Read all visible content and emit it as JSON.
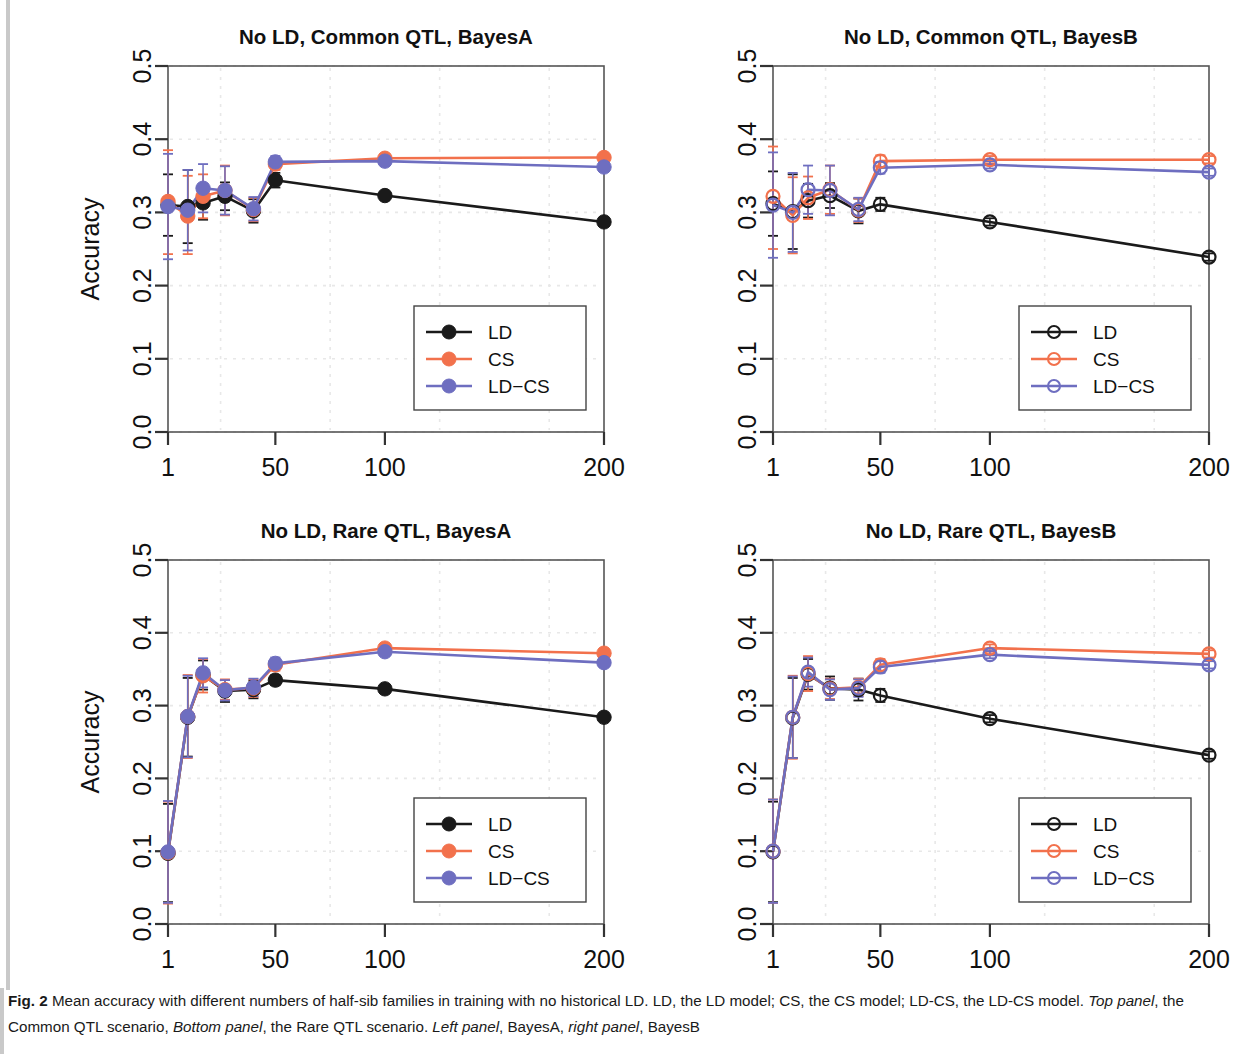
{
  "figure": {
    "label": "Fig. 2",
    "caption_part1": " Mean accuracy with different numbers of half-sib families in training with no historical LD. LD, the LD model; CS, the CS model; LD-CS, the LD-CS model. ",
    "caption_italic1": "Top panel",
    "caption_part2": ", the Common QTL scenario, ",
    "caption_italic2": "Bottom panel",
    "caption_part3": ", the Rare QTL scenario. ",
    "caption_italic3": "Left panel",
    "caption_part4": ", BayesA, ",
    "caption_italic4": "right panel",
    "caption_part5": ", BayesB"
  },
  "colors": {
    "LD": "#1a1a1a",
    "CS": "#F2714C",
    "LD-CS": "#6E6EC0",
    "axis": "#3a3a3a",
    "grid": "#e8e8e8"
  },
  "chart_data": [
    {
      "type": "line",
      "panel_id": "top-left",
      "title": "No LD, Common QTL, BayesA",
      "xlabel": "",
      "ylabel": "Accuracy",
      "marker": "filled",
      "xlim": [
        1,
        200
      ],
      "ylim": [
        0.0,
        0.5
      ],
      "xticks": [
        1,
        50,
        100,
        200
      ],
      "xticklabels": [
        "1",
        "50",
        "100",
        "200"
      ],
      "yticks": [
        0.0,
        0.1,
        0.2,
        0.3,
        0.4,
        0.5
      ],
      "yticklabels": [
        "0.0",
        "0.1",
        "0.2",
        "0.3",
        "0.4",
        "0.5"
      ],
      "grid": true,
      "legend_position": "bottom-right",
      "x": [
        1,
        10,
        17,
        27,
        40,
        50,
        100,
        200
      ],
      "series": [
        {
          "name": "LD",
          "values": [
            0.31,
            0.308,
            0.313,
            0.322,
            0.302,
            0.344,
            0.323,
            0.287
          ],
          "err_low": [
            0.268,
            0.258,
            0.29,
            0.303,
            0.286,
            0.334,
            0.318,
            0.283
          ],
          "err_high": [
            0.352,
            0.358,
            0.336,
            0.341,
            0.318,
            0.354,
            0.328,
            0.291
          ]
        },
        {
          "name": "CS",
          "values": [
            0.315,
            0.295,
            0.322,
            0.33,
            0.304,
            0.366,
            0.374,
            0.375
          ],
          "err_low": [
            0.243,
            0.243,
            0.292,
            0.296,
            0.288,
            0.358,
            0.369,
            0.37
          ],
          "err_high": [
            0.385,
            0.35,
            0.352,
            0.364,
            0.32,
            0.374,
            0.379,
            0.38
          ]
        },
        {
          "name": "LD-CS",
          "values": [
            0.308,
            0.303,
            0.333,
            0.33,
            0.305,
            0.369,
            0.37,
            0.362
          ],
          "err_low": [
            0.236,
            0.248,
            0.3,
            0.297,
            0.289,
            0.361,
            0.365,
            0.357
          ],
          "err_high": [
            0.38,
            0.358,
            0.366,
            0.363,
            0.321,
            0.377,
            0.375,
            0.367
          ]
        }
      ]
    },
    {
      "type": "line",
      "panel_id": "top-right",
      "title": "No LD, Common QTL, BayesB",
      "xlabel": "",
      "ylabel": "",
      "marker": "open",
      "xlim": [
        1,
        200
      ],
      "ylim": [
        0.0,
        0.5
      ],
      "xticks": [
        1,
        50,
        100,
        200
      ],
      "xticklabels": [
        "1",
        "50",
        "100",
        "200"
      ],
      "yticks": [
        0.0,
        0.1,
        0.2,
        0.3,
        0.4,
        0.5
      ],
      "yticklabels": [
        "0.0",
        "0.1",
        "0.2",
        "0.3",
        "0.4",
        "0.5"
      ],
      "grid": true,
      "legend_position": "bottom-right",
      "x": [
        1,
        10,
        17,
        27,
        40,
        50,
        100,
        200
      ],
      "series": [
        {
          "name": "LD",
          "values": [
            0.312,
            0.301,
            0.316,
            0.323,
            0.302,
            0.311,
            0.287,
            0.239
          ],
          "err_low": [
            0.268,
            0.25,
            0.293,
            0.306,
            0.285,
            0.302,
            0.282,
            0.234
          ],
          "err_high": [
            0.356,
            0.352,
            0.339,
            0.34,
            0.319,
            0.32,
            0.292,
            0.244
          ]
        },
        {
          "name": "CS",
          "values": [
            0.322,
            0.296,
            0.32,
            0.331,
            0.303,
            0.37,
            0.372,
            0.372
          ],
          "err_low": [
            0.25,
            0.244,
            0.291,
            0.298,
            0.287,
            0.362,
            0.367,
            0.367
          ],
          "err_high": [
            0.39,
            0.348,
            0.349,
            0.364,
            0.319,
            0.378,
            0.377,
            0.377
          ]
        },
        {
          "name": "LD-CS",
          "values": [
            0.31,
            0.3,
            0.331,
            0.33,
            0.304,
            0.361,
            0.365,
            0.355
          ],
          "err_low": [
            0.238,
            0.246,
            0.298,
            0.296,
            0.288,
            0.353,
            0.36,
            0.35
          ],
          "err_high": [
            0.382,
            0.354,
            0.364,
            0.364,
            0.32,
            0.369,
            0.37,
            0.36
          ]
        }
      ]
    },
    {
      "type": "line",
      "panel_id": "bottom-left",
      "title": "No LD, Rare QTL, BayesA",
      "xlabel": "No. half-sib families in training",
      "ylabel": "Accuracy",
      "marker": "filled",
      "xlim": [
        1,
        200
      ],
      "ylim": [
        0.0,
        0.5
      ],
      "xticks": [
        1,
        50,
        100,
        200
      ],
      "xticklabels": [
        "1",
        "50",
        "100",
        "200"
      ],
      "yticks": [
        0.0,
        0.1,
        0.2,
        0.3,
        0.4,
        0.5
      ],
      "yticklabels": [
        "0.0",
        "0.1",
        "0.2",
        "0.3",
        "0.4",
        "0.5"
      ],
      "grid": true,
      "legend_position": "bottom-right",
      "x": [
        1,
        10,
        17,
        27,
        40,
        50,
        100,
        200
      ],
      "series": [
        {
          "name": "LD",
          "values": [
            0.097,
            0.284,
            0.342,
            0.32,
            0.322,
            0.335,
            0.323,
            0.284
          ],
          "err_low": [
            0.03,
            0.23,
            0.322,
            0.305,
            0.31,
            0.328,
            0.318,
            0.28
          ],
          "err_high": [
            0.165,
            0.338,
            0.362,
            0.335,
            0.334,
            0.342,
            0.328,
            0.288
          ]
        },
        {
          "name": "CS",
          "values": [
            0.098,
            0.285,
            0.341,
            0.322,
            0.324,
            0.356,
            0.379,
            0.372
          ],
          "err_low": [
            0.028,
            0.228,
            0.318,
            0.308,
            0.312,
            0.348,
            0.374,
            0.367
          ],
          "err_high": [
            0.168,
            0.342,
            0.364,
            0.336,
            0.336,
            0.364,
            0.384,
            0.377
          ]
        },
        {
          "name": "LD-CS",
          "values": [
            0.099,
            0.285,
            0.345,
            0.321,
            0.325,
            0.358,
            0.374,
            0.359
          ],
          "err_low": [
            0.029,
            0.229,
            0.325,
            0.307,
            0.313,
            0.35,
            0.369,
            0.354
          ],
          "err_high": [
            0.169,
            0.341,
            0.365,
            0.335,
            0.337,
            0.366,
            0.379,
            0.364
          ]
        }
      ]
    },
    {
      "type": "line",
      "panel_id": "bottom-right",
      "title": "No LD, Rare QTL, BayesB",
      "xlabel": "No. half-sib families in training",
      "ylabel": "",
      "marker": "open",
      "xlim": [
        1,
        200
      ],
      "ylim": [
        0.0,
        0.5
      ],
      "xticks": [
        1,
        50,
        100,
        200
      ],
      "xticklabels": [
        "1",
        "50",
        "100",
        "200"
      ],
      "yticks": [
        0.0,
        0.1,
        0.2,
        0.3,
        0.4,
        0.5
      ],
      "yticklabels": [
        "0.0",
        "0.1",
        "0.2",
        "0.3",
        "0.4",
        "0.5"
      ],
      "grid": true,
      "legend_position": "bottom-right",
      "x": [
        1,
        10,
        17,
        27,
        40,
        50,
        100,
        200
      ],
      "series": [
        {
          "name": "LD",
          "values": [
            0.099,
            0.283,
            0.343,
            0.324,
            0.322,
            0.314,
            0.282,
            0.232
          ],
          "err_low": [
            0.03,
            0.228,
            0.322,
            0.308,
            0.307,
            0.305,
            0.277,
            0.227
          ],
          "err_high": [
            0.168,
            0.338,
            0.364,
            0.34,
            0.337,
            0.323,
            0.287,
            0.237
          ]
        },
        {
          "name": "CS",
          "values": [
            0.1,
            0.284,
            0.344,
            0.323,
            0.325,
            0.356,
            0.379,
            0.371
          ],
          "err_low": [
            0.029,
            0.227,
            0.32,
            0.309,
            0.313,
            0.348,
            0.374,
            0.366
          ],
          "err_high": [
            0.171,
            0.341,
            0.368,
            0.337,
            0.337,
            0.364,
            0.384,
            0.376
          ]
        },
        {
          "name": "LD-CS",
          "values": [
            0.1,
            0.284,
            0.346,
            0.322,
            0.324,
            0.353,
            0.37,
            0.356
          ],
          "err_low": [
            0.029,
            0.228,
            0.326,
            0.308,
            0.312,
            0.345,
            0.365,
            0.351
          ],
          "err_high": [
            0.171,
            0.34,
            0.366,
            0.336,
            0.336,
            0.361,
            0.375,
            0.361
          ]
        }
      ]
    }
  ],
  "legend": {
    "entries": [
      "LD",
      "CS",
      "LD-CS"
    ]
  }
}
